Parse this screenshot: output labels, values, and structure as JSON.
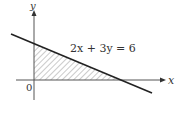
{
  "diagram": {
    "equation_label": "2x + 3y = 6",
    "x_axis_label": "x",
    "y_axis_label": "y",
    "origin_label": "0",
    "colors": {
      "line": "#222222",
      "axis": "#555555",
      "hatch": "#888888",
      "text": "#333333"
    },
    "shaded_region": "triangle bounded by x-axis, y-axis and line 2x + 3y = 6 (first quadrant)",
    "intercepts": {
      "x": 3,
      "y": 2
    }
  }
}
